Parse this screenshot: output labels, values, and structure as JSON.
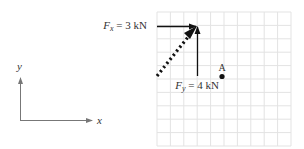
{
  "figure": {
    "type": "force-vector-diagram",
    "coordinate_axes": {
      "x_label": "x",
      "y_label": "y"
    },
    "grid": {
      "columns": 10,
      "rows": 10,
      "color": "#e0e0e0"
    },
    "forces": [
      {
        "name": "Fx",
        "symbol": "F",
        "subscript": "x",
        "equals": "=",
        "value": "3",
        "unit": "kN",
        "direction": "horizontal, pointing right",
        "style": "solid"
      },
      {
        "name": "Fy",
        "symbol": "F",
        "subscript": "y",
        "equals": "=",
        "value": "4",
        "unit": "kN",
        "direction": "vertical, pointing up",
        "style": "solid"
      },
      {
        "name": "resultant",
        "direction": "diagonal, up-right",
        "style": "dotted"
      }
    ],
    "point": {
      "label": "A"
    },
    "colors": {
      "vector": "#111111",
      "axis": "#777777",
      "grid": "#e3e3e3",
      "text": "#333333"
    }
  }
}
